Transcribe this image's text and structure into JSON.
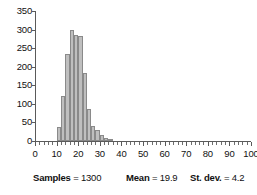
{
  "chart_data": {
    "type": "bar",
    "title": "",
    "subtitle": "",
    "xlabel": "",
    "ylabel": "",
    "xlim": [
      0,
      100
    ],
    "ylim": [
      0,
      350
    ],
    "grid": false,
    "legend": null,
    "bin_width": 2,
    "x_major_step": 10,
    "x_minor_step": 2,
    "y_major_step": 50,
    "bar_color": "#bfbfbf",
    "bar_edge_color": "#8a8a8a",
    "axis_color": "#5a5a5a",
    "x_tick_labels": [
      "0",
      "10",
      "20",
      "30",
      "40",
      "50",
      "60",
      "70",
      "80",
      "90",
      "100"
    ],
    "x_tick_values": [
      0,
      10,
      20,
      30,
      40,
      50,
      60,
      70,
      80,
      90,
      100
    ],
    "y_tick_labels": [
      "0",
      "50",
      "100",
      "150",
      "200",
      "250",
      "300",
      "350"
    ],
    "y_tick_values": [
      0,
      50,
      100,
      150,
      200,
      250,
      300,
      350
    ],
    "bin_starts": [
      10,
      12,
      14,
      16,
      18,
      20,
      22,
      24,
      26,
      28,
      30,
      32,
      34
    ],
    "categories": [
      "10-12",
      "12-14",
      "14-16",
      "16-18",
      "18-20",
      "20-22",
      "22-24",
      "24-26",
      "26-28",
      "28-30",
      "30-32",
      "32-34",
      "34-36"
    ],
    "values": [
      38,
      120,
      235,
      298,
      285,
      283,
      182,
      85,
      41,
      30,
      15,
      8,
      4
    ],
    "annotations": []
  },
  "stats": {
    "samples": {
      "label": "Samples",
      "separator": "=",
      "value": "1300"
    },
    "mean": {
      "label": "Mean",
      "separator": "=",
      "value": "19.9"
    },
    "stdev": {
      "label": "St. dev.",
      "separator": "=",
      "value": "4.2"
    }
  }
}
